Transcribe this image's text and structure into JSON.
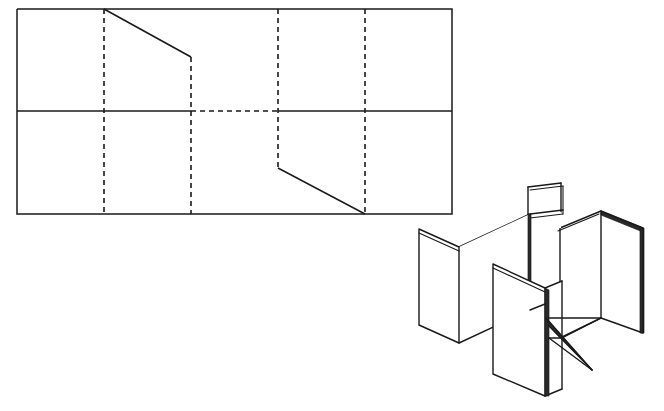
{
  "figure": {
    "background_color": "#ffffff",
    "line_color": "#1a1a1a",
    "canvas": {
      "width": 664,
      "height": 411
    }
  },
  "flat_pattern": {
    "name": "flat-development-pattern",
    "description": "Rectangular sheet development with crease lines and two diagonal cuts",
    "outer_rectangle": {
      "x": 17,
      "y": 9,
      "width": 435,
      "height": 205
    },
    "outer_outline_points": "17,9 452,9 452,214 17,214 17,9",
    "middle_horizontal": {
      "y": 111,
      "solid_left": {
        "x1": 17,
        "x2": 191
      },
      "dashed_middle": {
        "x1": 191,
        "x2": 278
      },
      "solid_right": {
        "x1": 278,
        "x2": 452
      }
    },
    "crease_lines": [
      {
        "label": "crease-1",
        "style": "dashed",
        "x": 104,
        "y1": 9,
        "y2": 214
      },
      {
        "label": "crease-2",
        "style": "dashed",
        "x": 191,
        "y1": 57,
        "y2": 214
      },
      {
        "label": "crease-3",
        "style": "dashed",
        "x": 278,
        "y1": 9,
        "y2": 168
      },
      {
        "label": "crease-4",
        "style": "dashed",
        "x": 365,
        "y1": 9,
        "y2": 214
      }
    ],
    "cut_lines": [
      {
        "label": "upper-diagonal-cut",
        "style": "solid",
        "points": "104,9 191,57"
      },
      {
        "label": "lower-diagonal-cut",
        "style": "solid",
        "points": "278,168 365,214"
      }
    ],
    "panel_columns_x": [
      17,
      104,
      191,
      278,
      365,
      452
    ],
    "panel_rows_y": [
      9,
      111,
      214
    ]
  },
  "assembled_model": {
    "name": "isometric-assembled-model",
    "description": "Isometric view of the pattern folded into upright interlocking panels with visible sheet thickness",
    "bounds": {
      "x": 415,
      "y": 180,
      "width": 232,
      "height": 220
    },
    "panels": [
      {
        "label": "left-wing-panel",
        "outline": "419,229 459,247 459,343 419,325"
      },
      {
        "label": "left-return-panel",
        "outline": "459,247 530,214 530,310 459,343"
      },
      {
        "label": "upper-back-panel",
        "outline": "528,187 560,183 560,210 528,214"
      },
      {
        "label": "center-front-panel",
        "outline": "493,264 545,288 545,396 493,374"
      },
      {
        "label": "center-back-panel",
        "outline": "545,288 560,281 560,389 545,396"
      },
      {
        "label": "right-wing-panel",
        "outline": "601,211 643,228 643,333 601,318"
      },
      {
        "label": "right-return-panel",
        "outline": "560,228 601,211 601,318 560,338"
      },
      {
        "label": "wedge-sliver",
        "outline": "545,318 592,370 548,327"
      }
    ]
  }
}
